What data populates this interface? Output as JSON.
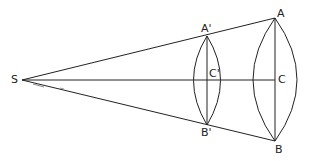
{
  "diagram": {
    "type": "ray-cone-lens-projection",
    "colors": {
      "stroke": "#222222",
      "background": "#ffffff"
    },
    "points": {
      "S": {
        "label": "S",
        "x": 22,
        "y": 80
      },
      "A1": {
        "label": "A'",
        "x": 207,
        "y": 36
      },
      "C1": {
        "label": "C'",
        "x": 207,
        "y": 80
      },
      "B1": {
        "label": "B'",
        "x": 207,
        "y": 125
      },
      "A": {
        "label": "A",
        "x": 275,
        "y": 18
      },
      "C": {
        "label": "C",
        "x": 275,
        "y": 80
      },
      "B": {
        "label": "B",
        "x": 275,
        "y": 141
      }
    },
    "labels": {
      "S": "S",
      "A_prime": "A'",
      "C_prime": "C'",
      "B_prime": "B'",
      "A": "A",
      "C": "C",
      "B": "B"
    }
  }
}
